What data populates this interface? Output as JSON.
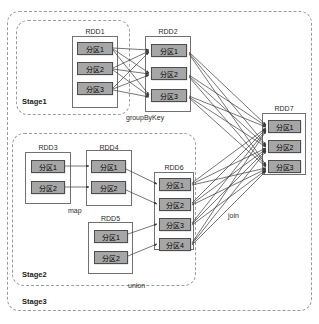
{
  "diagram": {
    "canvas": {
      "width": 319,
      "height": 324
    },
    "colors": {
      "partition_fill": "#a6a6a6",
      "partition_border": "#4d4d4d",
      "rdd_border": "#707070",
      "stage_border": "#9b9b9b",
      "arrow": "#3a3a3a",
      "background": "#ffffff"
    }
  },
  "stages": [
    {
      "id": "stage1",
      "label": "Stage1",
      "x": 16,
      "y": 20,
      "w": 114,
      "h": 95,
      "label_x": 22,
      "label_y": 97
    },
    {
      "id": "stage2",
      "label": "Stage2",
      "x": 12,
      "y": 133,
      "w": 184,
      "h": 153,
      "label_x": 22,
      "label_y": 270
    },
    {
      "id": "stage3",
      "label": "Stage3",
      "x": 7,
      "y": 11,
      "w": 305,
      "h": 300,
      "label_x": 22,
      "label_y": 297
    }
  ],
  "rdds": [
    {
      "id": "rdd1",
      "name": "RDD1",
      "x": 72,
      "y": 36,
      "w": 46,
      "h": 72,
      "title_x": 72,
      "title_y": 28,
      "title_w": 46,
      "partitions": [
        {
          "label": "分区1",
          "x": 77,
          "y": 42,
          "w": 36,
          "h": 13
        },
        {
          "label": "分区2",
          "x": 77,
          "y": 62,
          "w": 36,
          "h": 13
        },
        {
          "label": "分区3",
          "x": 77,
          "y": 82,
          "w": 36,
          "h": 13
        }
      ]
    },
    {
      "id": "rdd2",
      "name": "RDD2",
      "x": 145,
      "y": 36,
      "w": 46,
      "h": 76,
      "title_x": 145,
      "title_y": 28,
      "title_w": 46,
      "partitions": [
        {
          "label": "分区1",
          "x": 151,
          "y": 44,
          "w": 36,
          "h": 13
        },
        {
          "label": "分区2",
          "x": 151,
          "y": 67,
          "w": 36,
          "h": 13
        },
        {
          "label": "分区3",
          "x": 151,
          "y": 89,
          "w": 36,
          "h": 13
        }
      ]
    },
    {
      "id": "rdd3",
      "name": "RDD3",
      "x": 25,
      "y": 152,
      "w": 46,
      "h": 52,
      "title_x": 25,
      "title_y": 144,
      "title_w": 46,
      "partitions": [
        {
          "label": "分区1",
          "x": 31,
          "y": 160,
          "w": 34,
          "h": 13
        },
        {
          "label": "分区2",
          "x": 31,
          "y": 181,
          "w": 34,
          "h": 13
        }
      ]
    },
    {
      "id": "rdd4",
      "name": "RDD4",
      "x": 86,
      "y": 150,
      "w": 46,
      "h": 56,
      "title_x": 86,
      "title_y": 144,
      "title_w": 46,
      "partitions": [
        {
          "label": "分区1",
          "x": 91,
          "y": 160,
          "w": 35,
          "h": 13
        },
        {
          "label": "分区2",
          "x": 91,
          "y": 181,
          "w": 35,
          "h": 13
        }
      ]
    },
    {
      "id": "rdd5",
      "name": "RDD5",
      "x": 88,
      "y": 222,
      "w": 45,
      "h": 52,
      "title_x": 88,
      "title_y": 215,
      "title_w": 45,
      "partitions": [
        {
          "label": "分区1",
          "x": 94,
          "y": 230,
          "w": 34,
          "h": 13
        },
        {
          "label": "分区2",
          "x": 94,
          "y": 251,
          "w": 34,
          "h": 13
        }
      ]
    },
    {
      "id": "rdd6",
      "name": "RDD6",
      "x": 154,
      "y": 172,
      "w": 40,
      "h": 78,
      "title_x": 154,
      "title_y": 164,
      "title_w": 40,
      "partitions": [
        {
          "label": "分区1",
          "x": 159,
          "y": 178,
          "w": 32,
          "h": 13
        },
        {
          "label": "分区2",
          "x": 159,
          "y": 198,
          "w": 32,
          "h": 13
        },
        {
          "label": "分区3",
          "x": 159,
          "y": 218,
          "w": 32,
          "h": 13
        },
        {
          "label": "分区4",
          "x": 159,
          "y": 238,
          "w": 32,
          "h": 13
        }
      ]
    },
    {
      "id": "rdd7",
      "name": "RDD7",
      "x": 262,
      "y": 113,
      "w": 44,
      "h": 62,
      "title_x": 262,
      "title_y": 105,
      "title_w": 44,
      "partitions": [
        {
          "label": "分区1",
          "x": 268,
          "y": 120,
          "w": 33,
          "h": 13
        },
        {
          "label": "分区2",
          "x": 268,
          "y": 140,
          "w": 33,
          "h": 13
        },
        {
          "label": "分区3",
          "x": 268,
          "y": 160,
          "w": 33,
          "h": 13
        }
      ]
    }
  ],
  "operations": [
    {
      "id": "groupByKey",
      "label": "groupByKey",
      "x": 126,
      "y": 114
    },
    {
      "id": "map",
      "label": "map",
      "x": 68,
      "y": 207
    },
    {
      "id": "union",
      "label": "union",
      "x": 128,
      "y": 282
    },
    {
      "id": "join",
      "label": "join",
      "x": 228,
      "y": 212
    }
  ],
  "edges": [
    {
      "from": "rdd1.p1",
      "to": "rdd2.p1",
      "x1": 113,
      "y1": 48,
      "x2": 149,
      "y2": 50
    },
    {
      "from": "rdd1.p1",
      "to": "rdd2.p2",
      "x1": 113,
      "y1": 49,
      "x2": 149,
      "y2": 73
    },
    {
      "from": "rdd1.p1",
      "to": "rdd2.p3",
      "x1": 113,
      "y1": 50,
      "x2": 149,
      "y2": 95
    },
    {
      "from": "rdd1.p2",
      "to": "rdd2.p1",
      "x1": 113,
      "y1": 68,
      "x2": 149,
      "y2": 51
    },
    {
      "from": "rdd1.p2",
      "to": "rdd2.p2",
      "x1": 113,
      "y1": 69,
      "x2": 149,
      "y2": 74
    },
    {
      "from": "rdd1.p2",
      "to": "rdd2.p3",
      "x1": 113,
      "y1": 70,
      "x2": 149,
      "y2": 96
    },
    {
      "from": "rdd1.p3",
      "to": "rdd2.p1",
      "x1": 113,
      "y1": 88,
      "x2": 149,
      "y2": 52
    },
    {
      "from": "rdd1.p3",
      "to": "rdd2.p2",
      "x1": 113,
      "y1": 89,
      "x2": 149,
      "y2": 75
    },
    {
      "from": "rdd1.p3",
      "to": "rdd2.p3",
      "x1": 113,
      "y1": 90,
      "x2": 149,
      "y2": 97
    },
    {
      "from": "rdd3.p1",
      "to": "rdd4.p1",
      "x1": 65,
      "y1": 166,
      "x2": 89,
      "y2": 166
    },
    {
      "from": "rdd3.p2",
      "to": "rdd4.p2",
      "x1": 65,
      "y1": 187,
      "x2": 89,
      "y2": 187
    },
    {
      "from": "rdd4.p1",
      "to": "rdd6.p1",
      "x1": 126,
      "y1": 169,
      "x2": 157,
      "y2": 184
    },
    {
      "from": "rdd4.p2",
      "to": "rdd6.p2",
      "x1": 126,
      "y1": 190,
      "x2": 157,
      "y2": 204
    },
    {
      "from": "rdd5.p1",
      "to": "rdd6.p3",
      "x1": 128,
      "y1": 234,
      "x2": 157,
      "y2": 224
    },
    {
      "from": "rdd5.p2",
      "to": "rdd6.p4",
      "x1": 128,
      "y1": 256,
      "x2": 157,
      "y2": 244
    },
    {
      "from": "rdd2.p1",
      "to": "rdd7.p1",
      "x1": 189,
      "y1": 52,
      "x2": 266,
      "y2": 125
    },
    {
      "from": "rdd2.p1",
      "to": "rdd7.p2",
      "x1": 189,
      "y1": 53,
      "x2": 266,
      "y2": 145
    },
    {
      "from": "rdd2.p1",
      "to": "rdd7.p3",
      "x1": 189,
      "y1": 54,
      "x2": 266,
      "y2": 165
    },
    {
      "from": "rdd2.p2",
      "to": "rdd7.p1",
      "x1": 189,
      "y1": 75,
      "x2": 266,
      "y2": 126
    },
    {
      "from": "rdd2.p2",
      "to": "rdd7.p2",
      "x1": 189,
      "y1": 76,
      "x2": 266,
      "y2": 146
    },
    {
      "from": "rdd2.p2",
      "to": "rdd7.p3",
      "x1": 189,
      "y1": 77,
      "x2": 266,
      "y2": 166
    },
    {
      "from": "rdd2.p3",
      "to": "rdd7.p1",
      "x1": 189,
      "y1": 96,
      "x2": 266,
      "y2": 127
    },
    {
      "from": "rdd2.p3",
      "to": "rdd7.p2",
      "x1": 189,
      "y1": 97,
      "x2": 266,
      "y2": 147
    },
    {
      "from": "rdd2.p3",
      "to": "rdd7.p3",
      "x1": 189,
      "y1": 98,
      "x2": 266,
      "y2": 167
    },
    {
      "from": "rdd6.p1",
      "to": "rdd7.p1",
      "x1": 192,
      "y1": 183,
      "x2": 266,
      "y2": 128
    },
    {
      "from": "rdd6.p1",
      "to": "rdd7.p2",
      "x1": 192,
      "y1": 184,
      "x2": 266,
      "y2": 148
    },
    {
      "from": "rdd6.p1",
      "to": "rdd7.p3",
      "x1": 192,
      "y1": 185,
      "x2": 266,
      "y2": 168
    },
    {
      "from": "rdd6.p2",
      "to": "rdd7.p1",
      "x1": 192,
      "y1": 203,
      "x2": 266,
      "y2": 129
    },
    {
      "from": "rdd6.p2",
      "to": "rdd7.p2",
      "x1": 192,
      "y1": 204,
      "x2": 266,
      "y2": 149
    },
    {
      "from": "rdd6.p2",
      "to": "rdd7.p3",
      "x1": 192,
      "y1": 205,
      "x2": 266,
      "y2": 169
    },
    {
      "from": "rdd6.p3",
      "to": "rdd7.p1",
      "x1": 192,
      "y1": 223,
      "x2": 266,
      "y2": 130
    },
    {
      "from": "rdd6.p3",
      "to": "rdd7.p2",
      "x1": 192,
      "y1": 224,
      "x2": 266,
      "y2": 150
    },
    {
      "from": "rdd6.p3",
      "to": "rdd7.p3",
      "x1": 192,
      "y1": 225,
      "x2": 266,
      "y2": 170
    },
    {
      "from": "rdd6.p4",
      "to": "rdd7.p1",
      "x1": 192,
      "y1": 243,
      "x2": 266,
      "y2": 131
    },
    {
      "from": "rdd6.p4",
      "to": "rdd7.p2",
      "x1": 192,
      "y1": 244,
      "x2": 266,
      "y2": 151
    },
    {
      "from": "rdd6.p4",
      "to": "rdd7.p3",
      "x1": 192,
      "y1": 245,
      "x2": 266,
      "y2": 171
    }
  ]
}
